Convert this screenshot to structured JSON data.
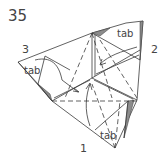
{
  "step": {
    "number": "35"
  },
  "labels": {
    "corner_1": "1",
    "corner_2": "2",
    "corner_3": "3",
    "tab_left": "tab",
    "tab_top_right": "tab",
    "tab_bottom": "tab"
  },
  "colors": {
    "line": "#3a3a3a",
    "shade": "#8c8c8c",
    "text": "#444444",
    "background": "#ffffff"
  }
}
